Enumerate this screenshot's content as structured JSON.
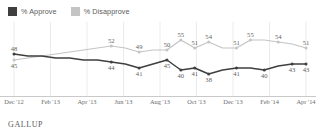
{
  "legend": {
    "items": [
      {
        "label": "% Approve",
        "color": "#3f3f3f",
        "icon": "square-marker-icon"
      },
      {
        "label": "% Disapprove",
        "color": "#c4c4c4",
        "icon": "square-marker-icon"
      }
    ]
  },
  "footer": {
    "source": "GALLUP"
  },
  "chart_data": {
    "type": "line",
    "title": "",
    "subtitle": "",
    "xlabel": "",
    "ylabel": "",
    "ylim": [
      34,
      58
    ],
    "grid": true,
    "grid_axis": "x",
    "legend_position": "top-left",
    "x": [
      "Dec '12",
      "Jan '13",
      "Feb '13",
      "Mar '13",
      "Apr '13",
      "May '13",
      "Jun '13",
      "Jul '13",
      "Aug '13",
      "Sep '13",
      "Oct '13",
      "Oct '13 b",
      "Nov '13",
      "Nov '13 b",
      "Dec '13",
      "Dec '13 b",
      "Jan '14",
      "Jan '14 b",
      "Feb '14",
      "Feb '14 b",
      "Mar '14",
      "Apr '14"
    ],
    "tick_labels": [
      "Dec '12",
      "Feb '13",
      "Apr '13",
      "Jun '13",
      "Aug '13",
      "Oct '13",
      "Dec '13",
      "Feb '14",
      "Apr '14"
    ],
    "series": [
      {
        "name": "% Approve",
        "color": "#3f3f3f",
        "values": [
          48,
          47,
          47,
          46,
          46,
          45,
          45,
          44,
          43,
          41,
          43,
          45,
          40,
          41,
          38,
          40,
          41,
          41,
          40,
          42,
          43,
          43
        ],
        "labeled_points": [
          {
            "index": 0,
            "value": 48,
            "position": "above"
          },
          {
            "index": 7,
            "value": 44,
            "position": "below"
          },
          {
            "index": 9,
            "value": 41,
            "position": "below"
          },
          {
            "index": 11,
            "value": 45,
            "position": "below"
          },
          {
            "index": 12,
            "value": 40,
            "position": "below"
          },
          {
            "index": 13,
            "value": 41,
            "position": "below"
          },
          {
            "index": 14,
            "value": 38,
            "position": "below"
          },
          {
            "index": 16,
            "value": 41,
            "position": "below"
          },
          {
            "index": 18,
            "value": 40,
            "position": "below"
          },
          {
            "index": 20,
            "value": 43,
            "position": "below"
          },
          {
            "index": 21,
            "value": 43,
            "position": "below"
          }
        ]
      },
      {
        "name": "% Disapprove",
        "color": "#c4c4c4",
        "values": [
          45,
          46,
          47,
          48,
          49,
          50,
          51,
          52,
          51,
          49,
          50,
          50,
          55,
          51,
          54,
          51,
          51,
          55,
          55,
          54,
          53,
          51
        ],
        "labeled_points": [
          {
            "index": 0,
            "value": 45,
            "position": "below"
          },
          {
            "index": 7,
            "value": 52,
            "position": "above"
          },
          {
            "index": 9,
            "value": 49,
            "position": "above"
          },
          {
            "index": 11,
            "value": 50,
            "position": "above"
          },
          {
            "index": 12,
            "value": 55,
            "position": "above"
          },
          {
            "index": 13,
            "value": 51,
            "position": "above"
          },
          {
            "index": 14,
            "value": 54,
            "position": "above"
          },
          {
            "index": 16,
            "value": 51,
            "position": "above"
          },
          {
            "index": 17,
            "value": 55,
            "position": "above"
          },
          {
            "index": 19,
            "value": 54,
            "position": "above"
          },
          {
            "index": 21,
            "value": 51,
            "position": "above"
          }
        ]
      }
    ]
  }
}
